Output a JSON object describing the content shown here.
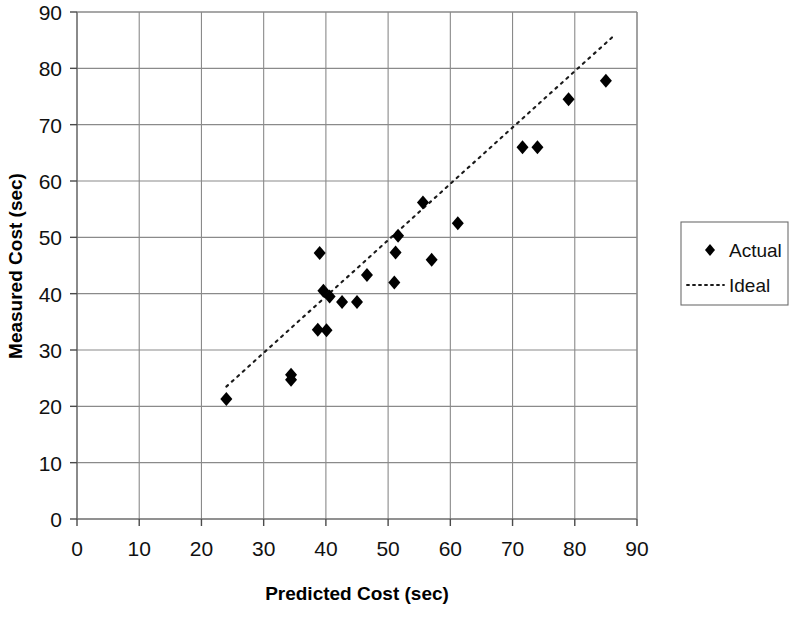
{
  "chart_data": {
    "type": "scatter",
    "title": "",
    "xlabel": "Predicted Cost (sec)",
    "ylabel": "Measured Cost (sec)",
    "xlim": [
      0,
      90
    ],
    "ylim": [
      0,
      90
    ],
    "xticks": [
      0,
      10,
      20,
      30,
      40,
      50,
      60,
      70,
      80,
      90
    ],
    "yticks": [
      0,
      10,
      20,
      30,
      40,
      50,
      60,
      70,
      80,
      90
    ],
    "xtick_labels": [
      "0",
      "10",
      "20",
      "30",
      "40",
      "50",
      "60",
      "70",
      "80",
      "90"
    ],
    "ytick_labels": [
      "0",
      "10",
      "20",
      "30",
      "40",
      "50",
      "60",
      "70",
      "80",
      "90"
    ],
    "grid": true,
    "legend_position": "right",
    "series": [
      {
        "name": "Actual",
        "type": "scatter",
        "marker": "diamond",
        "color": "#000000",
        "points": [
          [
            24.0,
            21.3
          ],
          [
            34.4,
            25.6
          ],
          [
            34.4,
            24.7
          ],
          [
            38.7,
            33.6
          ],
          [
            40.1,
            33.5
          ],
          [
            39.0,
            47.2
          ],
          [
            39.6,
            40.5
          ],
          [
            40.6,
            39.5
          ],
          [
            42.6,
            38.5
          ],
          [
            45.0,
            38.5
          ],
          [
            46.6,
            43.3
          ],
          [
            51.0,
            42.0
          ],
          [
            51.2,
            47.3
          ],
          [
            51.6,
            50.3
          ],
          [
            55.6,
            56.2
          ],
          [
            57.0,
            46.0
          ],
          [
            61.2,
            52.5
          ],
          [
            71.6,
            66.0
          ],
          [
            74.0,
            66.0
          ],
          [
            79.0,
            74.5
          ],
          [
            85.0,
            77.8
          ]
        ]
      },
      {
        "name": "Ideal",
        "type": "line",
        "style": "dotted",
        "color": "#1a1a1a",
        "x": [
          24.0,
          86.0
        ],
        "y": [
          23.5,
          85.5
        ]
      }
    ],
    "legend": [
      {
        "label": "Actual",
        "glyph": "diamond-marker"
      },
      {
        "label": "Ideal",
        "glyph": "dotted-line"
      }
    ]
  },
  "colors": {
    "marker": "#000000",
    "grid": "#8a8a8a",
    "axis": "#6d6d6d",
    "text": "#111111",
    "background": "#ffffff"
  }
}
